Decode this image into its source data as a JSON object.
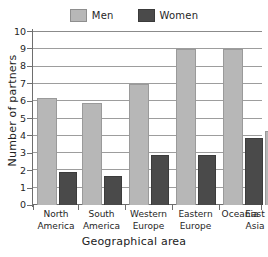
{
  "chart_data": {
    "type": "bar",
    "title": "",
    "subtitle": "",
    "xlabel": "Geographical area",
    "ylabel": "Number of partners",
    "categories": [
      "North America",
      "South America",
      "Western Europe",
      "Eastern Europe",
      "Oceania",
      "East Asia"
    ],
    "category_lines": [
      [
        "North",
        "America"
      ],
      [
        "South",
        "America"
      ],
      [
        "Western",
        "Europe"
      ],
      [
        "Eastern",
        "Europe"
      ],
      [
        "Oceania",
        ""
      ],
      [
        "East",
        "Asia"
      ]
    ],
    "series": [
      {
        "name": "Men",
        "color": "#b7b7b7",
        "values": [
          6.2,
          5.9,
          7.0,
          9.0,
          9.0,
          4.3
        ]
      },
      {
        "name": "Women",
        "color": "#4a4a4a",
        "values": [
          1.9,
          1.7,
          2.9,
          2.9,
          3.9,
          1.95
        ]
      }
    ],
    "ylim": [
      0,
      10
    ],
    "yticks": [
      0,
      1,
      2,
      3,
      4,
      5,
      6,
      7,
      8,
      9,
      10
    ],
    "ytick_labels": [
      "0",
      "1",
      "2",
      "3",
      "4",
      "5",
      "6",
      "7",
      "8",
      "9",
      "10"
    ],
    "grid": true,
    "grid_axis": "y",
    "legend_position": "top-center",
    "bar_group_gap": true
  },
  "legend": {
    "entries": [
      {
        "label": "Men",
        "swatch": "men-swatch",
        "color": "#b7b7b7"
      },
      {
        "label": "Women",
        "swatch": "women-swatch",
        "color": "#4a4a4a"
      }
    ]
  },
  "colors": {
    "men": "#b7b7b7",
    "women": "#4a4a4a",
    "grid": "#9d9d9d",
    "axis": "#6e6e6e",
    "text": "#262626",
    "background": "#ffffff"
  }
}
